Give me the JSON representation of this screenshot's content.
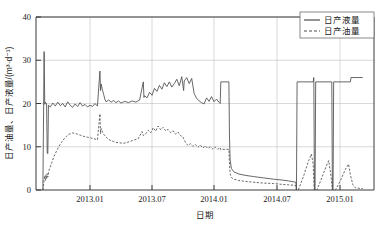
{
  "chart_data": {
    "type": "line",
    "title": "",
    "xlabel": "日期",
    "ylabel": "日产油量、日产液量/(m³·d⁻¹)",
    "ylim": [
      0,
      40
    ],
    "yticks": [
      0,
      10,
      20,
      30,
      40
    ],
    "ytick_labels": [
      "0",
      "10",
      "20",
      "30",
      "40"
    ],
    "xticks": [
      "2013.01",
      "2013.07",
      "2014.01",
      "2014.07",
      "2015.01"
    ],
    "xlim": [
      "2012.08",
      "2015.05"
    ],
    "grid": true,
    "legend_position": "top-right",
    "legend": [
      "日产液量",
      "日产油量"
    ],
    "series": [
      {
        "name": "日产液量",
        "style": "solid",
        "color": "#4d4d4d",
        "points": [
          [
            2012.62,
            0
          ],
          [
            2012.63,
            32.0
          ],
          [
            2012.635,
            19.8
          ],
          [
            2012.64,
            20.3
          ],
          [
            2012.65,
            19.9
          ],
          [
            2012.655,
            8.5
          ],
          [
            2012.66,
            8.4
          ],
          [
            2012.665,
            19.6
          ],
          [
            2012.68,
            19.2
          ],
          [
            2012.7,
            20.1
          ],
          [
            2012.72,
            19.4
          ],
          [
            2012.74,
            20.3
          ],
          [
            2012.76,
            19.5
          ],
          [
            2012.78,
            20.0
          ],
          [
            2012.8,
            19.2
          ],
          [
            2012.82,
            20.4
          ],
          [
            2012.84,
            19.6
          ],
          [
            2012.86,
            19.1
          ],
          [
            2012.88,
            19.9
          ],
          [
            2012.9,
            19.3
          ],
          [
            2012.92,
            20.2
          ],
          [
            2012.94,
            19.4
          ],
          [
            2012.96,
            19.8
          ],
          [
            2012.98,
            19.2
          ],
          [
            2013.0,
            19.6
          ],
          [
            2013.02,
            19.3
          ],
          [
            2013.04,
            20.0
          ],
          [
            2013.06,
            19.4
          ],
          [
            2013.08,
            27.5
          ],
          [
            2013.085,
            23.0
          ],
          [
            2013.09,
            24.5
          ],
          [
            2013.1,
            23.2
          ],
          [
            2013.11,
            22.1
          ],
          [
            2013.12,
            21.0
          ],
          [
            2013.13,
            20.4
          ],
          [
            2013.15,
            20.8
          ],
          [
            2013.17,
            20.3
          ],
          [
            2013.19,
            20.7
          ],
          [
            2013.21,
            20.2
          ],
          [
            2013.23,
            20.6
          ],
          [
            2013.25,
            20.1
          ],
          [
            2013.28,
            20.5
          ],
          [
            2013.31,
            20.2
          ],
          [
            2013.34,
            20.6
          ],
          [
            2013.37,
            20.3
          ],
          [
            2013.4,
            20.8
          ],
          [
            2013.43,
            25.0
          ],
          [
            2013.435,
            21.4
          ],
          [
            2013.44,
            21.8
          ],
          [
            2013.46,
            21.3
          ],
          [
            2013.48,
            22.6
          ],
          [
            2013.5,
            21.9
          ],
          [
            2013.52,
            23.5
          ],
          [
            2013.54,
            22.8
          ],
          [
            2013.56,
            24.2
          ],
          [
            2013.58,
            23.3
          ],
          [
            2013.6,
            24.8
          ],
          [
            2013.62,
            23.9
          ],
          [
            2013.64,
            25.0
          ],
          [
            2013.66,
            23.8
          ],
          [
            2013.68,
            24.6
          ],
          [
            2013.7,
            25.6
          ],
          [
            2013.72,
            24.1
          ],
          [
            2013.74,
            26.2
          ],
          [
            2013.755,
            23.0
          ],
          [
            2013.76,
            25.2
          ],
          [
            2013.78,
            26.0
          ],
          [
            2013.8,
            24.6
          ],
          [
            2013.82,
            25.8
          ],
          [
            2013.84,
            22.3
          ],
          [
            2013.86,
            21.2
          ],
          [
            2013.88,
            20.6
          ],
          [
            2013.9,
            20.2
          ],
          [
            2013.92,
            19.9
          ],
          [
            2013.94,
            21.3
          ],
          [
            2013.96,
            20.5
          ],
          [
            2013.98,
            21.6
          ],
          [
            2014.0,
            20.4
          ],
          [
            2014.02,
            21.0
          ],
          [
            2014.04,
            20.3
          ],
          [
            2014.05,
            20.0
          ],
          [
            2014.055,
            25.0
          ],
          [
            2014.12,
            25.0
          ],
          [
            2014.125,
            12.0
          ],
          [
            2014.13,
            7.0
          ],
          [
            2014.14,
            5.0
          ],
          [
            2014.16,
            4.2
          ],
          [
            2014.2,
            3.7
          ],
          [
            2014.25,
            3.4
          ],
          [
            2014.32,
            3.1
          ],
          [
            2014.4,
            2.8
          ],
          [
            2014.48,
            2.5
          ],
          [
            2014.55,
            2.3
          ],
          [
            2014.6,
            2.1
          ],
          [
            2014.64,
            1.9
          ],
          [
            2014.66,
            1.8
          ],
          [
            2014.665,
            0
          ],
          [
            2014.67,
            25.0
          ],
          [
            2014.8,
            25.0
          ],
          [
            2014.805,
            26.0
          ],
          [
            2014.81,
            0
          ],
          [
            2014.815,
            0
          ],
          [
            2014.82,
            25.0
          ],
          [
            2014.95,
            25.0
          ],
          [
            2014.955,
            0
          ],
          [
            2014.96,
            0
          ],
          [
            2014.965,
            25.0
          ],
          [
            2015.1,
            25.0
          ],
          [
            2015.105,
            26.0
          ],
          [
            2015.2,
            26.0
          ]
        ]
      },
      {
        "name": "日产油量",
        "style": "dashed",
        "color": "#4d4d4d",
        "points": [
          [
            2012.62,
            0
          ],
          [
            2012.635,
            3.3
          ],
          [
            2012.64,
            2.2
          ],
          [
            2012.645,
            3.6
          ],
          [
            2012.65,
            2.5
          ],
          [
            2012.655,
            3.8
          ],
          [
            2012.66,
            3.0
          ],
          [
            2012.67,
            4.6
          ],
          [
            2012.69,
            6.2
          ],
          [
            2012.71,
            7.8
          ],
          [
            2012.73,
            9.0
          ],
          [
            2012.75,
            10.1
          ],
          [
            2012.77,
            11.0
          ],
          [
            2012.79,
            11.8
          ],
          [
            2012.81,
            12.4
          ],
          [
            2012.83,
            12.9
          ],
          [
            2012.86,
            13.2
          ],
          [
            2012.89,
            13.0
          ],
          [
            2012.92,
            12.7
          ],
          [
            2012.95,
            12.4
          ],
          [
            2012.98,
            12.2
          ],
          [
            2013.01,
            12.0
          ],
          [
            2013.04,
            11.8
          ],
          [
            2013.06,
            11.6
          ],
          [
            2013.08,
            17.6
          ],
          [
            2013.085,
            13.0
          ],
          [
            2013.09,
            14.2
          ],
          [
            2013.1,
            13.5
          ],
          [
            2013.11,
            12.9
          ],
          [
            2013.13,
            12.2
          ],
          [
            2013.15,
            11.7
          ],
          [
            2013.17,
            11.4
          ],
          [
            2013.19,
            11.2
          ],
          [
            2013.21,
            11.0
          ],
          [
            2013.24,
            10.9
          ],
          [
            2013.27,
            10.8
          ],
          [
            2013.3,
            11.0
          ],
          [
            2013.33,
            11.3
          ],
          [
            2013.36,
            11.6
          ],
          [
            2013.39,
            11.9
          ],
          [
            2013.42,
            13.5
          ],
          [
            2013.43,
            12.6
          ],
          [
            2013.45,
            13.0
          ],
          [
            2013.47,
            13.8
          ],
          [
            2013.49,
            13.2
          ],
          [
            2013.51,
            14.4
          ],
          [
            2013.53,
            13.6
          ],
          [
            2013.55,
            14.8
          ],
          [
            2013.57,
            13.9
          ],
          [
            2013.59,
            14.5
          ],
          [
            2013.61,
            13.7
          ],
          [
            2013.63,
            14.0
          ],
          [
            2013.65,
            13.3
          ],
          [
            2013.67,
            13.7
          ],
          [
            2013.69,
            12.9
          ],
          [
            2013.71,
            13.4
          ],
          [
            2013.73,
            12.6
          ],
          [
            2013.75,
            12.2
          ],
          [
            2013.77,
            11.0
          ],
          [
            2013.79,
            10.3
          ],
          [
            2013.81,
            10.7
          ],
          [
            2013.83,
            10.1
          ],
          [
            2013.85,
            10.5
          ],
          [
            2013.87,
            9.9
          ],
          [
            2013.89,
            10.4
          ],
          [
            2013.91,
            9.7
          ],
          [
            2013.93,
            10.2
          ],
          [
            2013.95,
            9.6
          ],
          [
            2013.97,
            10.0
          ],
          [
            2013.99,
            9.5
          ],
          [
            2014.01,
            9.9
          ],
          [
            2014.03,
            9.4
          ],
          [
            2014.05,
            9.8
          ],
          [
            2014.053,
            9.5
          ],
          [
            2014.055,
            9.3
          ],
          [
            2014.06,
            9.4
          ],
          [
            2014.12,
            9.4
          ],
          [
            2014.125,
            6.0
          ],
          [
            2014.13,
            3.8
          ],
          [
            2014.14,
            2.9
          ],
          [
            2014.16,
            2.5
          ],
          [
            2014.2,
            2.2
          ],
          [
            2014.25,
            2.0
          ],
          [
            2014.32,
            1.8
          ],
          [
            2014.4,
            1.6
          ],
          [
            2014.48,
            1.5
          ],
          [
            2014.55,
            1.3
          ],
          [
            2014.6,
            1.2
          ],
          [
            2014.64,
            1.1
          ],
          [
            2014.66,
            1.0
          ],
          [
            2014.665,
            0
          ],
          [
            2014.68,
            0
          ],
          [
            2014.72,
            3.0
          ],
          [
            2014.76,
            6.5
          ],
          [
            2014.785,
            8.3
          ],
          [
            2014.8,
            6.0
          ],
          [
            2014.805,
            2.0
          ],
          [
            2014.81,
            0
          ],
          [
            2014.83,
            0
          ],
          [
            2014.865,
            2.5
          ],
          [
            2014.905,
            5.5
          ],
          [
            2014.925,
            6.8
          ],
          [
            2014.94,
            4.0
          ],
          [
            2014.95,
            1.5
          ],
          [
            2014.955,
            0
          ],
          [
            2014.98,
            0
          ],
          [
            2015.02,
            2.2
          ],
          [
            2015.06,
            4.8
          ],
          [
            2015.085,
            6.0
          ],
          [
            2015.1,
            3.5
          ],
          [
            2015.12,
            1.2
          ],
          [
            2015.14,
            0.5
          ],
          [
            2015.2,
            0.3
          ]
        ]
      }
    ]
  },
  "axis": {
    "y_label": "日产油量、日产液量/(m³·d⁻¹)",
    "x_label": "日期"
  },
  "legend": {
    "items": [
      {
        "label": "日产液量",
        "style": "solid"
      },
      {
        "label": "日产油量",
        "style": "dashed"
      }
    ]
  }
}
